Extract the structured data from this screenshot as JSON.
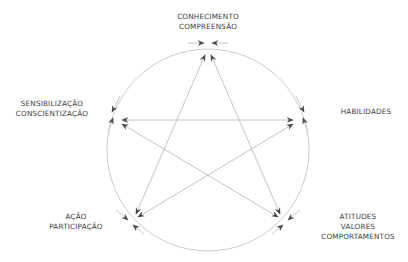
{
  "diagram": {
    "type": "cycle-star",
    "colors": {
      "line": "#b5b5b5",
      "arrow": "#4a4a4a",
      "text": "#3a3a3a",
      "background": "#ffffff"
    },
    "nodes": [
      {
        "id": "conhecimento",
        "lines": [
          "CONHECIMENTO",
          "COMPREENSÃO"
        ]
      },
      {
        "id": "habilidades",
        "lines": [
          "HABILIDADES"
        ]
      },
      {
        "id": "atitudes",
        "lines": [
          "ATITUDES",
          "VALORES",
          "COMPORTAMENTOS"
        ]
      },
      {
        "id": "acao",
        "lines": [
          "AÇÃO",
          "PARTICIPAÇÃO"
        ]
      },
      {
        "id": "sensibilizacao",
        "lines": [
          "SENSIBILIZAÇÃO",
          "CONSCIENTIZAÇÃO"
        ]
      }
    ],
    "edges": [
      [
        "conhecimento",
        "atitudes"
      ],
      [
        "atitudes",
        "sensibilizacao"
      ],
      [
        "sensibilizacao",
        "habilidades"
      ],
      [
        "habilidades",
        "acao"
      ],
      [
        "acao",
        "conhecimento"
      ]
    ],
    "circle": {
      "cx": 208,
      "cy": 150,
      "r": 101
    }
  }
}
